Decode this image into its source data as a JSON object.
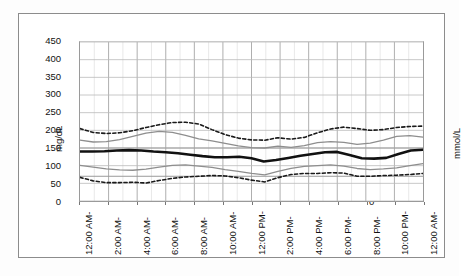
{
  "chart_data": {
    "type": "line",
    "title": "",
    "subtitle": "",
    "xlabel": "",
    "ylabel": "mg/dL",
    "y2label": "mmol/L",
    "ylim": [
      0,
      450
    ],
    "y2lim": [
      0,
      25
    ],
    "yticks": [
      0,
      50,
      100,
      150,
      200,
      250,
      300,
      350,
      400,
      450
    ],
    "y2ticks": [
      0,
      4,
      8,
      12,
      16,
      20,
      24
    ],
    "grid": true,
    "legend": "none",
    "x_tick_labels": [
      "12:00 AM-",
      "2:00 AM-",
      "4:00 AM-",
      "6:00 AM-",
      "8:00 AM-",
      "10:00 AM-",
      "12:00 PM-",
      "2:00 PM-",
      "4:00 PM-",
      "6:00 PM-",
      "8:00 PM-",
      "10:00 PM-",
      "12:00 AM-"
    ],
    "x_hours": [
      0,
      1,
      2,
      3,
      4,
      5,
      6,
      7,
      8,
      9,
      10,
      11,
      12,
      13,
      14,
      15,
      16,
      17,
      18,
      19,
      20,
      21,
      22,
      23,
      24
    ],
    "series": [
      {
        "name": "95th percentile",
        "style": "dashed",
        "color": "#1a1a1a",
        "width": 1.6,
        "values": [
          205,
          194,
          191,
          193,
          199,
          208,
          216,
          222,
          223,
          218,
          202,
          188,
          178,
          173,
          172,
          179,
          175,
          180,
          193,
          204,
          209,
          205,
          200,
          202,
          208,
          211,
          212
        ]
      },
      {
        "name": "75th percentile",
        "style": "solid",
        "color": "#8e8e8e",
        "width": 1.3,
        "values": [
          172,
          167,
          168,
          174,
          183,
          192,
          197,
          194,
          186,
          176,
          170,
          163,
          156,
          151,
          150,
          155,
          152,
          157,
          165,
          168,
          166,
          160,
          164,
          172,
          183,
          185,
          181
        ]
      },
      {
        "name": "Median",
        "style": "solid",
        "color": "#111111",
        "width": 2.6,
        "values": [
          140,
          140,
          141,
          143,
          144,
          143,
          140,
          138,
          135,
          131,
          127,
          124,
          124,
          125,
          121,
          112,
          116,
          122,
          128,
          133,
          138,
          139,
          130,
          121,
          120,
          122,
          133,
          143,
          145
        ]
      },
      {
        "name": "25th percentile",
        "style": "solid",
        "color": "#8e8e8e",
        "width": 1.3,
        "values": [
          101,
          96,
          91,
          88,
          87,
          90,
          96,
          101,
          102,
          99,
          95,
          89,
          84,
          78,
          74,
          84,
          92,
          98,
          100,
          102,
          99,
          92,
          89,
          91,
          94,
          100,
          106
        ]
      },
      {
        "name": "5th percentile",
        "style": "dashed",
        "color": "#1a1a1a",
        "width": 1.6,
        "values": [
          67,
          57,
          52,
          52,
          53,
          51,
          58,
          64,
          68,
          70,
          72,
          71,
          66,
          59,
          54,
          66,
          75,
          78,
          78,
          80,
          79,
          70,
          70,
          72,
          73,
          75,
          78
        ]
      }
    ],
    "target_band": {
      "low": 70,
      "high": 150,
      "color": "#9a9a9a"
    }
  }
}
